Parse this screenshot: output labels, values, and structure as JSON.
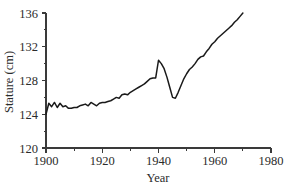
{
  "chart_data": {
    "type": "line",
    "title": "",
    "xlabel": "Year",
    "ylabel": "Stature (cm)",
    "xlim": [
      1900,
      1980
    ],
    "ylim": [
      120,
      136
    ],
    "grid": false,
    "legend": null,
    "x_major_ticks": [
      1900,
      1920,
      1940,
      1960,
      1980
    ],
    "x_minor_ticks": [
      1910,
      1930,
      1950,
      1970
    ],
    "y_major_ticks": [
      120,
      124,
      128,
      132,
      136
    ],
    "y_minor_ticks": [
      122,
      126,
      130,
      134
    ],
    "x_tick_labels": [
      "1900",
      "1920",
      "1940",
      "1960",
      "1980"
    ],
    "y_tick_labels": [
      "120",
      "124",
      "128",
      "132",
      "136"
    ],
    "series": [
      {
        "name": "Stature",
        "color": "#1a1a1a",
        "x": [
          1900,
          1901,
          1902,
          1903,
          1904,
          1905,
          1906,
          1907,
          1908,
          1909,
          1910,
          1911,
          1912,
          1913,
          1914,
          1915,
          1916,
          1917,
          1918,
          1919,
          1920,
          1921,
          1922,
          1923,
          1924,
          1925,
          1926,
          1927,
          1928,
          1929,
          1930,
          1931,
          1932,
          1933,
          1934,
          1935,
          1936,
          1937,
          1938,
          1939,
          1940,
          1941,
          1942,
          1943,
          1944,
          1945,
          1946,
          1947,
          1948,
          1949,
          1950,
          1951,
          1952,
          1953,
          1954,
          1955,
          1956,
          1957,
          1958,
          1959,
          1960,
          1961,
          1962,
          1963,
          1964,
          1965,
          1966,
          1967,
          1968,
          1969,
          1970
        ],
        "values": [
          124.0,
          125.3,
          124.9,
          125.4,
          124.8,
          125.3,
          124.9,
          125.0,
          124.7,
          124.7,
          124.8,
          124.8,
          125.0,
          125.1,
          125.2,
          125.0,
          125.4,
          125.2,
          125.0,
          125.3,
          125.4,
          125.4,
          125.5,
          125.6,
          125.8,
          126.0,
          125.9,
          126.3,
          126.4,
          126.3,
          126.6,
          126.8,
          127.0,
          127.2,
          127.4,
          127.6,
          127.9,
          128.2,
          128.3,
          128.3,
          130.4,
          130.0,
          129.4,
          128.4,
          127.2,
          126.0,
          125.9,
          126.6,
          127.4,
          128.2,
          128.8,
          129.3,
          129.6,
          130.0,
          130.5,
          130.8,
          130.9,
          131.4,
          131.8,
          132.3,
          132.6,
          133.0,
          133.3,
          133.6,
          133.9,
          134.2,
          134.5,
          134.9,
          135.2,
          135.6,
          136.0
        ]
      }
    ]
  },
  "labels": {
    "y_axis_title": "Stature (cm)",
    "x_axis_title": "Year"
  }
}
